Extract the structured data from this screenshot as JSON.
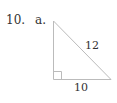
{
  "problem": {
    "number": "10.",
    "part": "a."
  },
  "figure": {
    "type": "right-triangle",
    "hypotenuse_label": "12",
    "base_label": "10",
    "right_angle_marker": "bottom-left",
    "stroke_color": "#bbbbbb"
  }
}
